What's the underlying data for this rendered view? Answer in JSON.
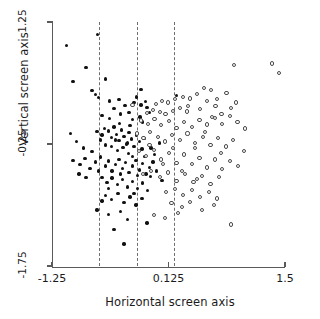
{
  "chart_data": {
    "type": "scatter",
    "title": "",
    "xlabel": "Horizontal screen axis",
    "ylabel": "Vertical screen axis",
    "xlim": [
      -1.25,
      1.5
    ],
    "ylim": [
      -1.75,
      1.25
    ],
    "xticks": [
      -1.25,
      0.125,
      1.5
    ],
    "xticklabels": [
      "-1.25",
      "0.125",
      "1.5"
    ],
    "yticks": [
      1.25,
      -0.25,
      -1.75
    ],
    "yticklabels": [
      "1.25",
      "-0.25",
      "-1.75"
    ],
    "grid": false,
    "legend": "none",
    "annotations": {
      "vertical_reference_lines": {
        "style": "dashed",
        "color": "#6e6e6e",
        "x": [
          -0.7,
          -0.25,
          0.19
        ]
      }
    },
    "series": [
      {
        "name": "Group 1",
        "marker": "filled-circle",
        "color": "#111111",
        "points": [
          [
            -0.71,
            1.1
          ],
          [
            -1.08,
            0.96
          ],
          [
            -0.85,
            0.69
          ],
          [
            -1.0,
            0.52
          ],
          [
            -0.62,
            0.55
          ],
          [
            -0.78,
            0.41
          ],
          [
            -0.74,
            0.36
          ],
          [
            -0.7,
            0.32
          ],
          [
            -0.57,
            0.28
          ],
          [
            -0.46,
            0.3
          ],
          [
            -0.52,
            0.19
          ],
          [
            -0.39,
            0.22
          ],
          [
            -0.28,
            0.26
          ],
          [
            -0.2,
            0.23
          ],
          [
            -0.15,
            0.27
          ],
          [
            -0.13,
            0.2
          ],
          [
            -0.66,
            0.1
          ],
          [
            -0.57,
            0.06
          ],
          [
            -0.44,
            0.12
          ],
          [
            -0.3,
            0.05
          ],
          [
            -0.21,
            0.08
          ],
          [
            -0.18,
            0.02
          ],
          [
            -0.1,
            0.14
          ],
          [
            0.22,
            0.35
          ],
          [
            -1.03,
            -0.12
          ],
          [
            -0.96,
            -0.22
          ],
          [
            -0.72,
            -0.1
          ],
          [
            -0.66,
            -0.14
          ],
          [
            -0.63,
            -0.06
          ],
          [
            -0.58,
            -0.09
          ],
          [
            -0.55,
            -0.17
          ],
          [
            -0.52,
            -0.04
          ],
          [
            -0.49,
            -0.13
          ],
          [
            -0.46,
            -0.21
          ],
          [
            -0.43,
            -0.08
          ],
          [
            -0.4,
            -0.16
          ],
          [
            -0.37,
            -0.25
          ],
          [
            -0.34,
            -0.11
          ],
          [
            -0.31,
            -0.19
          ],
          [
            -0.28,
            -0.28
          ],
          [
            -0.25,
            -0.14
          ],
          [
            -0.22,
            -0.22
          ],
          [
            -0.19,
            -0.31
          ],
          [
            -0.16,
            -0.18
          ],
          [
            -0.55,
            -0.28
          ],
          [
            -0.48,
            -0.33
          ],
          [
            -0.41,
            -0.29
          ],
          [
            -0.35,
            -0.37
          ],
          [
            -1.0,
            -0.45
          ],
          [
            -0.92,
            -0.5
          ],
          [
            -0.86,
            -0.43
          ],
          [
            -0.8,
            -0.55
          ],
          [
            -0.74,
            -0.47
          ],
          [
            -0.68,
            -0.41
          ],
          [
            -0.62,
            -0.52
          ],
          [
            -0.58,
            -0.46
          ],
          [
            -0.54,
            -0.58
          ],
          [
            -0.5,
            -0.5
          ],
          [
            -0.46,
            -0.44
          ],
          [
            -0.42,
            -0.55
          ],
          [
            -0.38,
            -0.48
          ],
          [
            -0.34,
            -0.6
          ],
          [
            -0.3,
            -0.52
          ],
          [
            -0.26,
            -0.45
          ],
          [
            -0.22,
            -0.57
          ],
          [
            -0.18,
            -0.49
          ],
          [
            -0.14,
            -0.62
          ],
          [
            -0.1,
            -0.54
          ],
          [
            -0.06,
            -0.47
          ],
          [
            -0.66,
            -0.66
          ],
          [
            -0.6,
            -0.72
          ],
          [
            -0.54,
            -0.67
          ],
          [
            -0.48,
            -0.75
          ],
          [
            -0.42,
            -0.69
          ],
          [
            -0.36,
            -0.78
          ],
          [
            -0.3,
            -0.71
          ],
          [
            -0.24,
            -0.8
          ],
          [
            -0.18,
            -0.73
          ],
          [
            -0.12,
            -0.82
          ],
          [
            -0.62,
            -0.88
          ],
          [
            -0.55,
            -0.93
          ],
          [
            -0.47,
            -0.86
          ],
          [
            -0.4,
            -0.97
          ],
          [
            -0.33,
            -0.9
          ],
          [
            -0.26,
            -1.0
          ],
          [
            -0.19,
            -0.92
          ],
          [
            -0.72,
            -1.06
          ],
          [
            -0.58,
            -1.12
          ],
          [
            -0.44,
            -1.08
          ],
          [
            -0.36,
            -1.18
          ],
          [
            -0.52,
            -1.3
          ],
          [
            -0.4,
            -1.48
          ],
          [
            -0.13,
            -1.22
          ],
          [
            -0.78,
            -0.34
          ],
          [
            -0.88,
            -0.3
          ],
          [
            -0.93,
            -0.62
          ],
          [
            -0.85,
            -0.66
          ],
          [
            -0.68,
            -0.2
          ],
          [
            -0.45,
            0.0
          ],
          [
            -0.33,
            -0.02
          ],
          [
            -0.25,
            0.33
          ],
          [
            -0.08,
            -0.3
          ],
          [
            -0.04,
            -0.38
          ],
          [
            0.02,
            -0.24
          ],
          [
            -0.09,
            -0.65
          ],
          [
            -0.02,
            -0.58
          ],
          [
            0.05,
            -0.7
          ],
          [
            -0.3,
            -0.4
          ],
          [
            -0.24,
            -0.64
          ],
          [
            -0.16,
            -0.4
          ],
          [
            -0.62,
            -0.26
          ],
          [
            -0.7,
            -0.58
          ],
          [
            -0.5,
            -0.2
          ],
          [
            -0.44,
            -0.62
          ],
          [
            -0.58,
            -0.8
          ],
          [
            -0.36,
            -0.24
          ],
          [
            -0.28,
            -0.86
          ],
          [
            -0.66,
            -0.95
          ],
          [
            -0.2,
            0.42
          ],
          [
            -0.34,
            0.14
          ]
        ]
      },
      {
        "name": "Group 2",
        "marker": "open-circle",
        "color": "#4a4a4a",
        "points": [
          [
            0.9,
            0.72
          ],
          [
            1.35,
            0.74
          ],
          [
            1.43,
            0.62
          ],
          [
            0.63,
            0.41
          ],
          [
            0.81,
            0.38
          ],
          [
            0.2,
            0.3
          ],
          [
            0.3,
            0.33
          ],
          [
            0.38,
            0.31
          ],
          [
            0.12,
            0.26
          ],
          [
            0.05,
            0.28
          ],
          [
            -0.02,
            0.24
          ],
          [
            -0.3,
            0.23
          ],
          [
            0.46,
            0.36
          ],
          [
            0.58,
            0.28
          ],
          [
            0.26,
            0.19
          ],
          [
            0.18,
            0.16
          ],
          [
            0.09,
            0.12
          ],
          [
            -0.06,
            0.17
          ],
          [
            -0.13,
            0.13
          ],
          [
            0.34,
            0.15
          ],
          [
            0.5,
            0.18
          ],
          [
            0.68,
            0.22
          ],
          [
            0.75,
            0.12
          ],
          [
            0.86,
            0.19
          ],
          [
            -0.2,
            0.04
          ],
          [
            -0.12,
            0.0
          ],
          [
            -0.04,
            0.06
          ],
          [
            0.04,
            -0.02
          ],
          [
            0.13,
            0.03
          ],
          [
            0.22,
            -0.05
          ],
          [
            0.31,
            0.02
          ],
          [
            0.4,
            -0.04
          ],
          [
            0.49,
            0.05
          ],
          [
            0.58,
            -0.01
          ],
          [
            0.67,
            0.07
          ],
          [
            0.76,
            0.0
          ],
          [
            0.85,
            0.09
          ],
          [
            0.94,
            0.02
          ],
          [
            1.03,
            -0.06
          ],
          [
            -0.25,
            -0.12
          ],
          [
            -0.17,
            -0.18
          ],
          [
            -0.09,
            -0.1
          ],
          [
            0.0,
            -0.16
          ],
          [
            0.08,
            -0.22
          ],
          [
            0.17,
            -0.14
          ],
          [
            0.26,
            -0.2
          ],
          [
            0.35,
            -0.12
          ],
          [
            0.44,
            -0.24
          ],
          [
            0.53,
            -0.16
          ],
          [
            0.62,
            -0.26
          ],
          [
            0.71,
            -0.18
          ],
          [
            0.8,
            -0.28
          ],
          [
            0.89,
            -0.2
          ],
          [
            -0.22,
            -0.34
          ],
          [
            -0.14,
            -0.4
          ],
          [
            -0.05,
            -0.32
          ],
          [
            0.04,
            -0.44
          ],
          [
            0.13,
            -0.36
          ],
          [
            0.22,
            -0.48
          ],
          [
            0.31,
            -0.38
          ],
          [
            0.4,
            -0.5
          ],
          [
            0.49,
            -0.42
          ],
          [
            0.58,
            -0.54
          ],
          [
            0.67,
            -0.44
          ],
          [
            0.76,
            -0.56
          ],
          [
            0.85,
            -0.46
          ],
          [
            -0.18,
            -0.62
          ],
          [
            -0.08,
            -0.58
          ],
          [
            0.02,
            -0.66
          ],
          [
            0.12,
            -0.6
          ],
          [
            0.22,
            -0.7
          ],
          [
            0.32,
            -0.62
          ],
          [
            0.42,
            -0.72
          ],
          [
            0.52,
            -0.64
          ],
          [
            0.62,
            -0.74
          ],
          [
            0.72,
            -0.66
          ],
          [
            0.1,
            -0.84
          ],
          [
            0.2,
            -0.8
          ],
          [
            0.3,
            -0.88
          ],
          [
            0.4,
            -0.82
          ],
          [
            0.5,
            -0.9
          ],
          [
            0.6,
            -0.84
          ],
          [
            0.7,
            -0.92
          ],
          [
            0.16,
            -0.98
          ],
          [
            0.28,
            -1.02
          ],
          [
            0.38,
            -0.96
          ],
          [
            0.52,
            -1.06
          ],
          [
            0.66,
            -1.0
          ],
          [
            -0.05,
            -1.12
          ],
          [
            0.08,
            -1.16
          ],
          [
            0.24,
            -1.1
          ],
          [
            0.86,
            -1.24
          ],
          [
            0.95,
            -0.52
          ],
          [
            1.02,
            -0.34
          ],
          [
            0.64,
            0.08
          ],
          [
            0.54,
            0.44
          ],
          [
            -0.1,
            -0.26
          ],
          [
            0.02,
            0.14
          ],
          [
            0.18,
            -0.3
          ],
          [
            0.46,
            -0.68
          ],
          [
            0.36,
            0.22
          ],
          [
            0.74,
            -0.36
          ],
          [
            0.28,
            -0.58
          ],
          [
            0.06,
            -0.5
          ],
          [
            0.44,
            -0.3
          ],
          [
            0.56,
            -0.1
          ],
          [
            0.7,
            0.3
          ],
          [
            0.92,
            0.26
          ]
        ]
      }
    ]
  }
}
